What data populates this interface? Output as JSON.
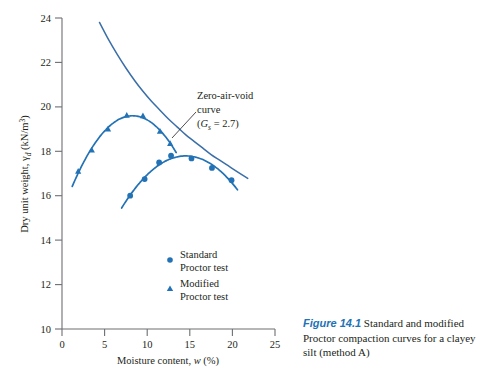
{
  "figure": {
    "caption_label": "Figure 14.1",
    "caption_text": " Standard and modified Proctor compaction curves for a clayey silt (method A)",
    "label_color": "#2272b5"
  },
  "colors": {
    "curve_blue": "#2272b5",
    "marker_blue": "#1f6fb2",
    "zav_blue": "#3a6ea8",
    "axis": "#6d6e71",
    "text": "#231f20"
  },
  "chart_data": {
    "type": "line",
    "title": "",
    "xlabel": "Moisture content, w (%)",
    "ylabel": "Dry unit weight, γd (kN/m3)",
    "xlabel_parts": {
      "prefix": "Moisture content, ",
      "italic": "w",
      "suffix": " (%)"
    },
    "ylabel_parts": {
      "prefix": "Dry unit weight, ",
      "symbol": "γ",
      "sub": "d",
      "suffix": " (kN/m",
      "sup": "3",
      "tail": ")"
    },
    "xlim": [
      0,
      25
    ],
    "ylim": [
      10,
      24
    ],
    "xticks": [
      0,
      5,
      10,
      15,
      20,
      25
    ],
    "yticks": [
      10,
      12,
      14,
      16,
      18,
      20,
      22,
      24
    ],
    "xtick_labels": [
      "0",
      "5",
      "10",
      "15",
      "20",
      "25"
    ],
    "ytick_labels": [
      "10",
      "12",
      "14",
      "16",
      "18",
      "20",
      "22",
      "24"
    ],
    "grid": false,
    "legend_position": "inside-lower-center",
    "series": [
      {
        "name": "Standard Proctor test",
        "marker": "circle",
        "label_line1": "Standard",
        "label_line2": "Proctor test",
        "color": "#2272b5",
        "x": [
          8.0,
          9.7,
          11.4,
          12.8,
          15.2,
          17.6,
          19.9
        ],
        "y": [
          16.0,
          16.75,
          17.5,
          17.8,
          17.68,
          17.25,
          16.7
        ],
        "curve_x_start": 7.0,
        "curve_x_end": 20.6
      },
      {
        "name": "Modified Proctor test",
        "marker": "triangle",
        "label_line1": "Modified",
        "label_line2": "Proctor test",
        "color": "#2272b5",
        "x": [
          1.9,
          3.5,
          5.4,
          7.6,
          9.5,
          11.5,
          12.7
        ],
        "y": [
          17.1,
          18.05,
          19.0,
          19.62,
          19.6,
          18.9,
          18.35
        ],
        "curve_x_start": 1.2,
        "curve_x_end": 13.4
      },
      {
        "name": "Zero-air-void curve",
        "marker": "none",
        "color": "#3a6ea8",
        "annotation_line1": "Zero-air-void",
        "annotation_line2": "curve",
        "annotation_line3_prefix": "(",
        "annotation_line3_symbol": "G",
        "annotation_line3_sub": "s",
        "annotation_line3_suffix": " = 2.7)",
        "Gs": 2.7,
        "x": [
          4.4,
          5.5,
          6.5,
          7.5,
          8.5,
          9.5,
          10.5,
          11.5,
          12.5,
          13.5,
          14.5,
          15.5,
          16.5,
          17.5,
          18.5,
          19.5,
          20.5,
          21.8
        ],
        "y": [
          23.8,
          23.0,
          22.35,
          21.75,
          21.2,
          20.7,
          20.25,
          19.85,
          19.45,
          19.1,
          18.75,
          18.45,
          18.15,
          17.85,
          17.6,
          17.35,
          17.1,
          16.78
        ]
      }
    ]
  }
}
